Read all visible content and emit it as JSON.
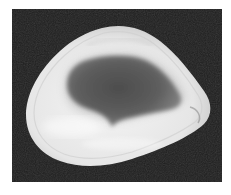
{
  "image": {
    "subject": "bivalve shell interior view",
    "background_color": "#1e1e1e",
    "frame_color": "#ffffff",
    "shell_rim_color": "#ececec",
    "shell_interior_color": "#5a5a5a"
  }
}
